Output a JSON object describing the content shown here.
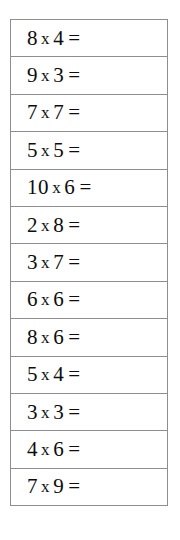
{
  "worksheet": {
    "kind": "multiplication-practice-table",
    "operator_symbol": "x",
    "equals_symbol": "=",
    "row_count": 13,
    "text_color": "#0d0d0d",
    "border_color": "#8e8e8e",
    "background_color": "#ffffff",
    "problems": [
      {
        "left": "8",
        "operator": "x",
        "right": "4",
        "equals": "="
      },
      {
        "left": "9",
        "operator": "x",
        "right": "3",
        "equals": "="
      },
      {
        "left": "7",
        "operator": "x",
        "right": "7",
        "equals": "="
      },
      {
        "left": "5",
        "operator": "x",
        "right": "5",
        "equals": "="
      },
      {
        "left": "10",
        "operator": "x",
        "right": "6",
        "equals": "="
      },
      {
        "left": "2",
        "operator": "x",
        "right": "8",
        "equals": "="
      },
      {
        "left": "3",
        "operator": "x",
        "right": "7",
        "equals": "="
      },
      {
        "left": "6",
        "operator": "x",
        "right": "6",
        "equals": "="
      },
      {
        "left": "8",
        "operator": "x",
        "right": "6",
        "equals": "="
      },
      {
        "left": "5",
        "operator": "x",
        "right": "4",
        "equals": "="
      },
      {
        "left": "3",
        "operator": "x",
        "right": "3",
        "equals": "="
      },
      {
        "left": "4",
        "operator": "x",
        "right": "6",
        "equals": "="
      },
      {
        "left": "7",
        "operator": "x",
        "right": "9",
        "equals": "="
      }
    ]
  }
}
